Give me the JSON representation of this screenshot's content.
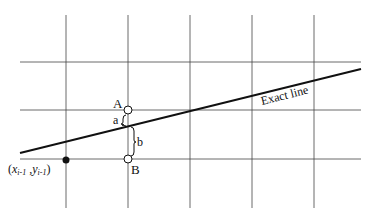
{
  "diagram": {
    "title": "",
    "labels": {
      "point_a": "A",
      "point_b": "B",
      "dist_a": "a",
      "dist_b": "b",
      "exact_line": "Exact line",
      "prev_point_x": "x",
      "prev_point_x_sub": "i-1",
      "prev_point_y": "y",
      "prev_point_y_sub": "i-1",
      "prev_point_open": "(",
      "prev_point_comma": " ,",
      "prev_point_close": ")"
    },
    "grid": {
      "vertical_x": [
        66,
        128,
        190,
        252,
        314
      ],
      "horizontal_y": [
        62,
        110,
        160
      ]
    },
    "colors": {
      "line": "#111111",
      "grid": "#333333",
      "background": "#ffffff"
    }
  }
}
